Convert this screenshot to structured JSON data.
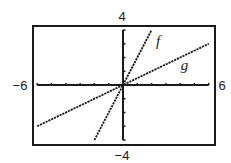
{
  "chart_data": {
    "type": "line",
    "title": "",
    "xlabel": "",
    "ylabel": "",
    "xlim": [
      -6,
      6
    ],
    "ylim": [
      -4,
      4
    ],
    "grid": false,
    "legend": "none",
    "axis_labels": {
      "xmin": "−6",
      "xmax": "6",
      "ymin": "−4",
      "ymax": "4"
    },
    "ticks": {
      "x": [
        -6,
        -5,
        -4,
        -3,
        -2,
        -1,
        0,
        1,
        2,
        3,
        4,
        5,
        6
      ],
      "y": [
        -4,
        -3,
        -2,
        -1,
        0,
        1,
        2,
        3,
        4
      ]
    },
    "series": [
      {
        "name": "f",
        "label": "f",
        "expression": "f(x) = 2x",
        "slope": 2,
        "intercept": 0,
        "x": [
          -2,
          2
        ],
        "y": [
          -4,
          4
        ],
        "style": "dashed",
        "label_at": [
          2.45,
          3.2
        ]
      },
      {
        "name": "g",
        "label": "g",
        "expression": "g(x) = x/2",
        "slope": 0.5,
        "intercept": 0,
        "x": [
          -6,
          6
        ],
        "y": [
          -3,
          3
        ],
        "style": "dashed",
        "label_at": [
          4.3,
          1.45
        ]
      }
    ]
  },
  "colors": {
    "ink": "#1a1a1a",
    "background": "#ffffff"
  }
}
